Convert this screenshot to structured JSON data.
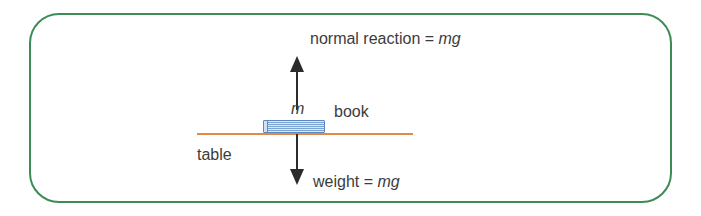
{
  "figure": {
    "type": "physics-free-body-diagram",
    "frame_color": "#3d8b55",
    "table_color": "#e08a45",
    "book_color": "#7ba4d4",
    "arrow_color": "#2b2b2b",
    "text_color": "#3c3c3c"
  },
  "labels": {
    "normal_reaction": {
      "prefix": "normal reaction = ",
      "symbol": "mg"
    },
    "weight": {
      "prefix": "weight = ",
      "symbol": "mg"
    },
    "mass_symbol": "m",
    "book": "book",
    "table": "table"
  },
  "forces": [
    {
      "name": "normal reaction",
      "direction": "up",
      "magnitude": "mg",
      "label": "normal reaction = mg"
    },
    {
      "name": "weight",
      "direction": "down",
      "magnitude": "mg",
      "label": "weight = mg"
    }
  ]
}
